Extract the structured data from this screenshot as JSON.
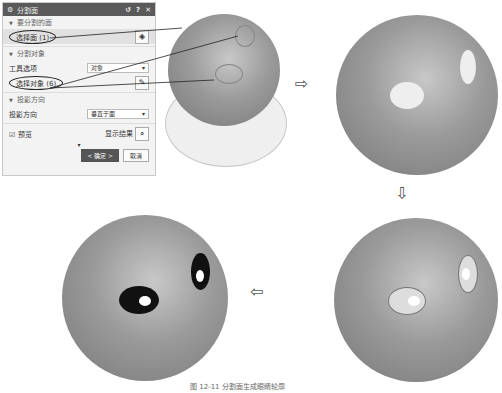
{
  "dialog": {
    "title": "分割面",
    "controls": {
      "reset": "↺",
      "help": "?",
      "close": "✕"
    },
    "sections": [
      {
        "header": "要分割的面",
        "rows": [
          {
            "label": "选择面 (1)",
            "icon": "face-select-icon"
          }
        ]
      },
      {
        "header": "分割对象",
        "rows": [
          {
            "label": "工具选项",
            "value": "对象"
          },
          {
            "label": "选择对象 (6)",
            "icon": "object-select-icon"
          }
        ]
      },
      {
        "header": "投影方向",
        "rows": [
          {
            "label": "投影方向",
            "value": "垂直于面"
          }
        ]
      }
    ],
    "preview_label": "预览",
    "preview_checked": true,
    "show_result_label": "显示结果",
    "ok_label": "< 确定 >",
    "cancel_label": "取消"
  },
  "caption": "图 12-11 分割面生成眼睛轮廓"
}
